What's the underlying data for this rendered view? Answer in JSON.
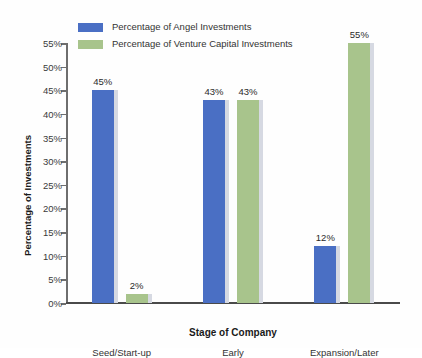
{
  "chart_data": {
    "type": "bar",
    "title": "",
    "xlabel": "Stage of Company",
    "ylabel": "Percentage of Investments",
    "categories": [
      "Seed/Start-up",
      "Early",
      "Expansion/Later"
    ],
    "series": [
      {
        "name": "Percentage of Angel Investments",
        "color": "#4a6fc4",
        "values": [
          45,
          43,
          12
        ],
        "labels": [
          "45%",
          "43%",
          "12%"
        ]
      },
      {
        "name": "Percentage of Venture Capital Investments",
        "color": "#a8c48c",
        "values": [
          2,
          43,
          55
        ],
        "labels": [
          "2%",
          "43%",
          "55%"
        ]
      }
    ],
    "ylim": [
      0,
      55
    ],
    "ytick_values": [
      0,
      5,
      10,
      15,
      20,
      25,
      30,
      35,
      40,
      45,
      50,
      55
    ],
    "ytick_labels": [
      "0%",
      "5%",
      "10%",
      "15%",
      "20%",
      "25%",
      "30%",
      "35%",
      "40%",
      "45%",
      "50%",
      "55%"
    ],
    "grid": false,
    "legend_position": "top-left"
  },
  "legend": {
    "items": [
      {
        "label": "Percentage of Angel Investments",
        "color": "#4a6fc4"
      },
      {
        "label": "Percentage of Venture Capital Investments",
        "color": "#a8c48c"
      }
    ]
  },
  "axes": {
    "y_title": "Percentage of Investments",
    "x_title": "Stage of Company"
  }
}
